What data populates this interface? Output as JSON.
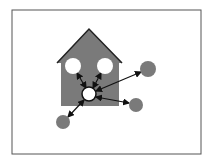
{
  "diagram": {
    "frame": {
      "x": 12,
      "y": 10,
      "w": 189,
      "h": 144,
      "stroke": "#555555"
    },
    "house": {
      "body": {
        "x": 61,
        "y": 61,
        "w": 58,
        "h": 45
      },
      "roof": {
        "apex": [
          89,
          29
        ],
        "left": [
          57,
          63
        ],
        "right": [
          122,
          63
        ]
      },
      "fill": "#7a7a7a",
      "roof_stroke": "#222222"
    },
    "nodes": [
      {
        "id": "hub",
        "cx": 89,
        "cy": 94,
        "r": 7,
        "fill": "#ffffff",
        "stroke": "#111111"
      },
      {
        "id": "window-left",
        "cx": 73,
        "cy": 66,
        "r": 8,
        "fill": "#ffffff",
        "stroke": "none"
      },
      {
        "id": "window-right",
        "cx": 105,
        "cy": 66,
        "r": 8,
        "fill": "#ffffff",
        "stroke": "none"
      },
      {
        "id": "outer-upper-right",
        "cx": 148,
        "cy": 69,
        "r": 8,
        "fill": "#7a7a7a",
        "stroke": "none"
      },
      {
        "id": "outer-lower-right",
        "cx": 136,
        "cy": 105,
        "r": 7,
        "fill": "#7a7a7a",
        "stroke": "none"
      },
      {
        "id": "outer-lower-left",
        "cx": 63,
        "cy": 122,
        "r": 7,
        "fill": "#7a7a7a",
        "stroke": "none"
      }
    ],
    "edges": [
      {
        "from": [
          86,
          88
        ],
        "to": [
          77,
          73
        ]
      },
      {
        "from": [
          93,
          88
        ],
        "to": [
          101,
          73
        ]
      },
      {
        "from": [
          96,
          91
        ],
        "to": [
          141,
          72
        ]
      },
      {
        "from": [
          96,
          97
        ],
        "to": [
          129,
          103
        ]
      },
      {
        "from": [
          84,
          100
        ],
        "to": [
          68,
          117
        ]
      }
    ],
    "edge_color": "#111111"
  }
}
